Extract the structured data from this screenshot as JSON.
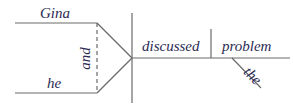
{
  "diagram": {
    "type": "sentence-diagram",
    "subjects": [
      {
        "word": "Gina"
      },
      {
        "word": "he"
      }
    ],
    "conjunction": "and",
    "verb": "discussed",
    "direct_object": "problem",
    "modifiers": [
      {
        "word": "the",
        "modifies": "problem"
      }
    ],
    "colors": {
      "line": "#6a6a6a",
      "text": "#2b2b52",
      "background": "#ffffff"
    }
  }
}
